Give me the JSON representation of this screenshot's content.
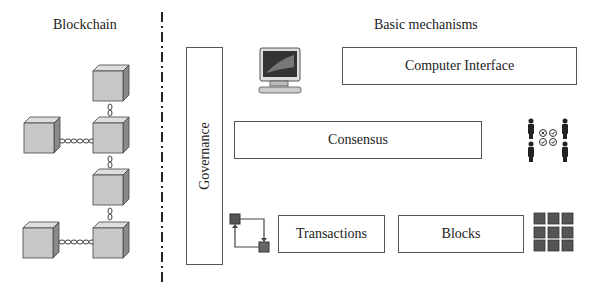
{
  "left_panel": {
    "title": "Blockchain"
  },
  "right_panel": {
    "title": "Basic mechanisms",
    "governance": "Governance",
    "computer_interface": "Computer Interface",
    "consensus": "Consensus",
    "transactions": "Transactions",
    "blocks": "Blocks"
  },
  "icons": {
    "computer": "computer-icon",
    "consensus_people": "voting-people-icon",
    "transactions": "transaction-flow-icon",
    "blocks": "block-grid-icon"
  },
  "colors": {
    "cube_face": "#c8c8c8",
    "cube_top": "#dedede",
    "cube_side": "#8a8a8a",
    "dark_square": "#555555",
    "border": "#555555"
  }
}
